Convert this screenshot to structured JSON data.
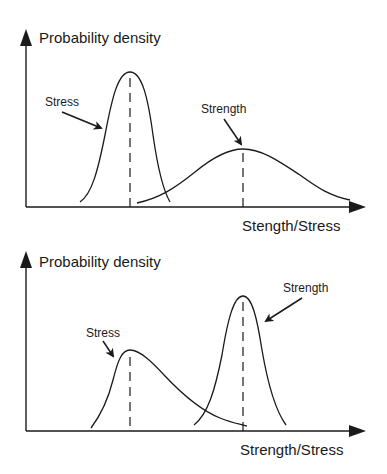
{
  "diagrams": [
    {
      "id": "top",
      "y_axis_label": "Probability density",
      "x_axis_label": "Stength/Stress",
      "curves": [
        {
          "name": "Stress",
          "label": "Stress",
          "shape": "narrow-normal",
          "mean_x": 130,
          "peak_y": 72
        },
        {
          "name": "Strength",
          "label": "Strength",
          "shape": "wide-normal",
          "mean_x": 243,
          "peak_y": 149
        }
      ]
    },
    {
      "id": "bottom",
      "y_axis_label": "Probability density",
      "x_axis_label": "Strength/Stress",
      "curves": [
        {
          "name": "Stress",
          "label": "Stress",
          "shape": "right-skewed",
          "mean_x": 130,
          "peak_y": 350
        },
        {
          "name": "Strength",
          "label": "Strength",
          "shape": "narrow-normal",
          "mean_x": 243,
          "peak_y": 296
        }
      ]
    }
  ],
  "colors": {
    "line": "#1a1a1a",
    "background": "#ffffff"
  }
}
